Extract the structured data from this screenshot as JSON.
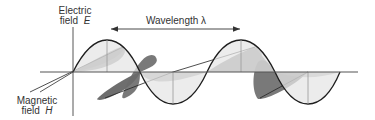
{
  "diagram": {
    "labels": {
      "electric_line1": "Electric",
      "electric_line2_prefix": "field",
      "electric_symbol": "E",
      "magnetic_line1": "Magnetic",
      "magnetic_line2_prefix": "field",
      "magnetic_symbol": "H",
      "wavelength": "Wavelength λ"
    },
    "colors": {
      "axis": "#555555",
      "electric_fill": "#e4e4e4",
      "electric_stroke": "#222222",
      "magnetic_fill": "#6e6e6e",
      "magnetic_fill_light": "#9a9a9a",
      "text": "#333333"
    },
    "geometry": {
      "origin": [
        73,
        72
      ],
      "wavelength_px": 135,
      "e_amplitude_px": 32,
      "wavelength_arrow": {
        "x1": 110,
        "x2": 240,
        "y": 29
      }
    }
  }
}
